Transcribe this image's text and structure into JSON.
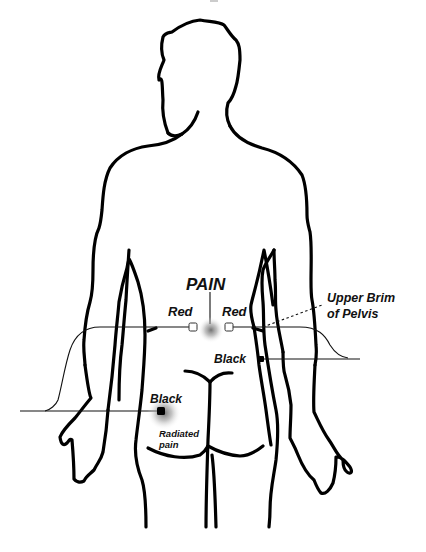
{
  "diagram": {
    "labels": {
      "pain": "PAIN",
      "red_left": "Red",
      "red_right": "Red",
      "upper_brim_line1": "Upper Brim",
      "upper_brim_line2": "of Pelvis",
      "black_right": "Black",
      "black_left": "Black",
      "radiated_line1": "Radiated",
      "radiated_line2": "pain"
    },
    "electrodes": [
      {
        "id": "red-left",
        "color": "Red",
        "style": "open-square",
        "x": 193,
        "y": 327
      },
      {
        "id": "red-right",
        "color": "Red",
        "style": "open-square",
        "x": 229,
        "y": 327
      },
      {
        "id": "black-right",
        "color": "Black",
        "style": "filled-square",
        "x": 261,
        "y": 359
      },
      {
        "id": "black-left",
        "color": "Black",
        "style": "filled-square",
        "x": 161,
        "y": 411
      }
    ],
    "pain_points": [
      {
        "id": "pain-center",
        "x": 211,
        "y": 330
      },
      {
        "id": "radiated-pain",
        "x": 163,
        "y": 412
      }
    ],
    "colors": {
      "outline": "#000000",
      "background": "#ffffff",
      "pain_glow": "#808080"
    }
  }
}
